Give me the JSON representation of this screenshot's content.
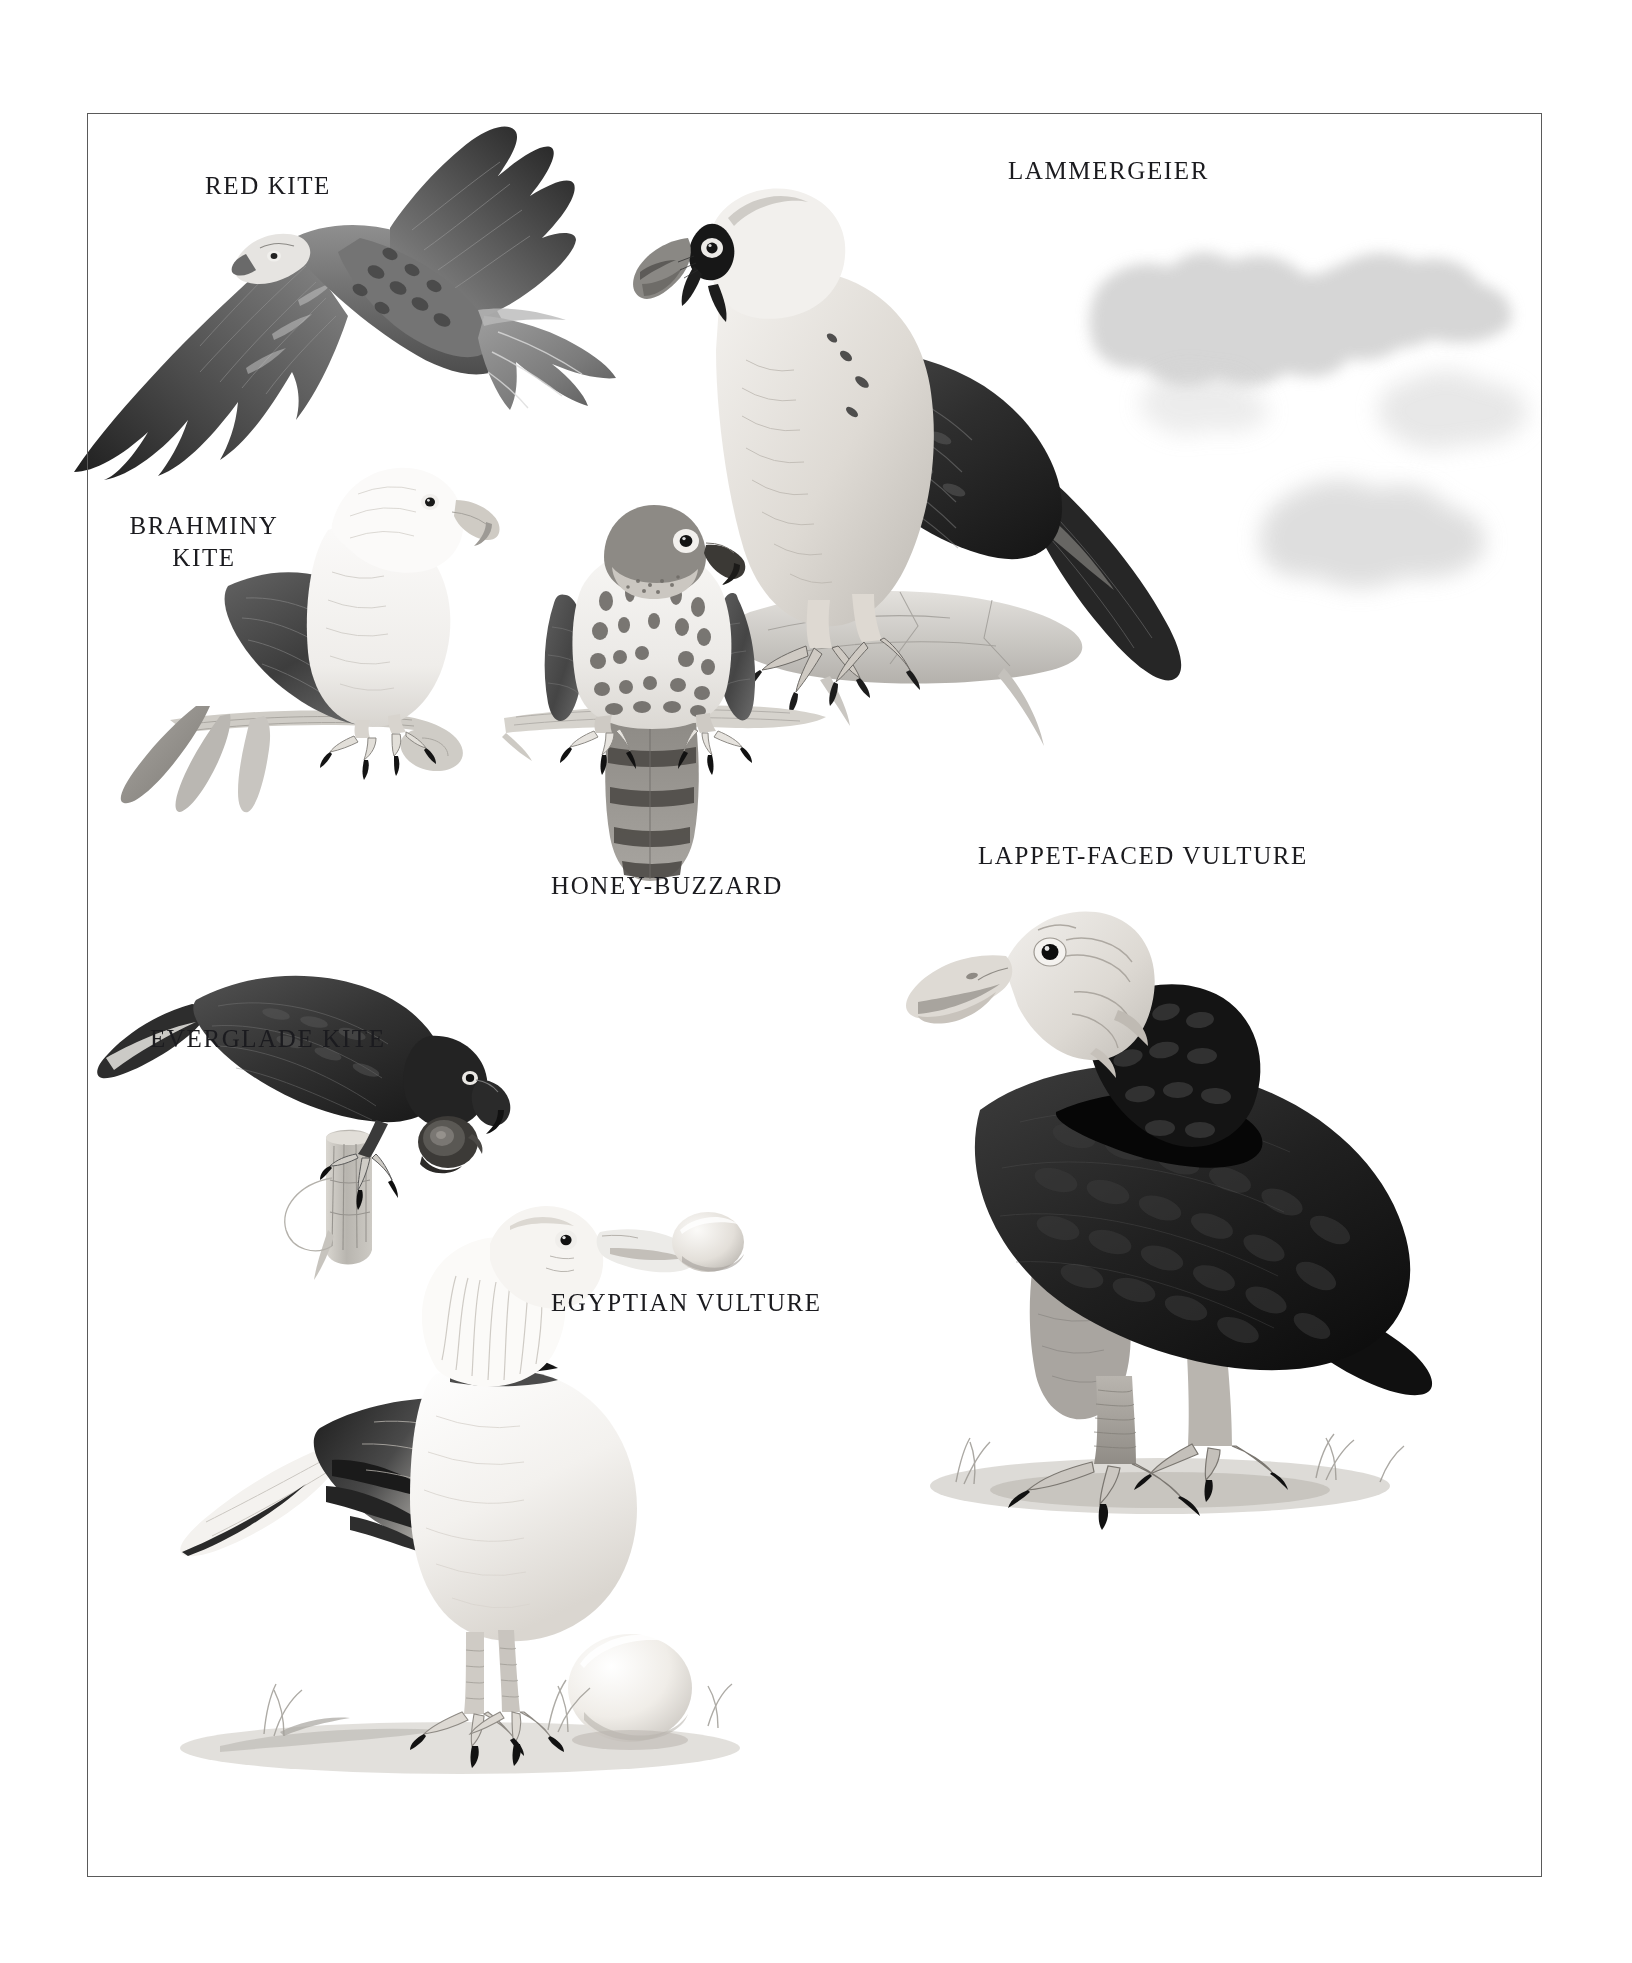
{
  "plate": {
    "kind": "natural-history-illustration-plate",
    "medium": "grayscale pencil-and-wash bird-of-prey plate",
    "background_color": "#ffffff",
    "frame_color": "#5a5a5a",
    "ink_color": "#1b1b1f",
    "frame": {
      "x": 87,
      "y": 113,
      "width": 1455,
      "height": 1764
    }
  },
  "labels": {
    "red_kite": "RED KITE",
    "lammergeier": "LAMMERGEIER",
    "brahminy_kite_line1": "BRAHMINY",
    "brahminy_kite_line2": "KITE",
    "honey_buzzard": "HONEY-BUZZARD",
    "everglade_kite": "EVERGLADE KITE",
    "lappet_faced_vulture": "LAPPET-FACED VULTURE",
    "egyptian_vulture": "EGYPTIAN VULTURE"
  },
  "subjects": [
    {
      "id": "red-kite",
      "label": "RED KITE",
      "pose": "in flight, seen from above, forked tail",
      "position": "upper-left",
      "label_x": 205,
      "label_y": 170
    },
    {
      "id": "lammergeier",
      "label": "LAMMERGEIER",
      "pose": "perched on rock, facing left, black wing, pale head with dark eye-stripe",
      "position": "upper-right",
      "label_x": 1008,
      "label_y": 155
    },
    {
      "id": "brahminy-kite",
      "label": "BRAHMINY KITE",
      "pose": "perched on a branch, white head and breast, dark wings",
      "position": "mid-left",
      "label_x": 124,
      "label_y": 510
    },
    {
      "id": "honey-buzzard",
      "label": "HONEY-BUZZARD",
      "pose": "perched frontally on a branch, barred tail, spotted breast",
      "position": "centre",
      "label_x": 551,
      "label_y": 870
    },
    {
      "id": "everglade-kite",
      "label": "EVERGLADE KITE",
      "pose": "perched on a stump holding a snail, dark plumage, hooked bill",
      "position": "mid-left-lower",
      "label_x": 150,
      "label_y": 1023
    },
    {
      "id": "lappet-faced-vulture",
      "label": "LAPPET-FACED VULTURE",
      "pose": "standing on ground, bare pale head, very dark body",
      "position": "right-lower",
      "label_x": 978,
      "label_y": 840
    },
    {
      "id": "egyptian-vulture",
      "label": "EGYPTIAN VULTURE",
      "pose": "standing on ground beside an egg, holding a stone in bill, white plumage with black flight feathers",
      "position": "bottom-centre",
      "label_x": 551,
      "label_y": 1287
    }
  ],
  "scene_elements": [
    {
      "name": "cloud-wisps",
      "description": "faint grey cloud washes behind the lammergeier, upper right"
    },
    {
      "name": "perch-branch-honey-buzzard",
      "description": "horizontal pale branch under the honey-buzzard"
    },
    {
      "name": "perch-branch-brahminy",
      "description": "curved pale branch under the brahminy kite"
    },
    {
      "name": "rock-ledge-lammergeier",
      "description": "pale rock ledge the lammergeier stands on"
    },
    {
      "name": "stump-everglade",
      "description": "weathered wooden stump the everglade kite grips"
    },
    {
      "name": "apple-snail",
      "description": "dark snail held by the everglade kite"
    },
    {
      "name": "stone-in-bill",
      "description": "pale stone held in the egyptian vulture's bill"
    },
    {
      "name": "ostrich-egg",
      "description": "large pale egg on the ground by the egyptian vulture"
    },
    {
      "name": "ground-grass-tufts",
      "description": "grey ground shading with small grass tufts at the bottom"
    }
  ]
}
